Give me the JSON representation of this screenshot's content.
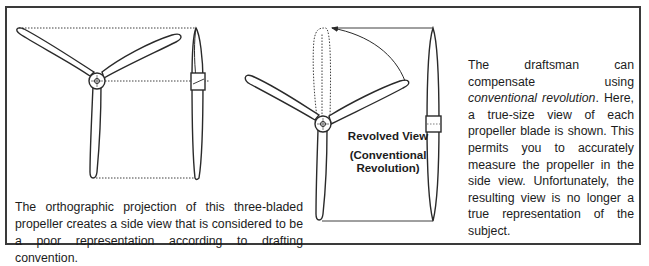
{
  "figure": {
    "left_caption": "The orthographic projection of this three-bladed propeller creates a side view that is considered to be a poor representation according to drafting convention.",
    "revolved_label": {
      "title": "Revolved View",
      "subtitle_line1": "(Conventional",
      "subtitle_line2": "Revolution)"
    },
    "right_caption": {
      "part1": "The draftsman can compensate using ",
      "emphasis": "conventional revolution",
      "part2": ". Here, a true-size view of each propeller blade is shown. This permits you to accurately measure the propeller in the side view. Unfortunately, the resulting view is no longer a true representation of the subject."
    },
    "colors": {
      "line": "#2a2a2a",
      "border": "#3a3a3a",
      "background": "#ffffff"
    },
    "drawings": [
      {
        "name": "front-view-propeller",
        "blades": 3
      },
      {
        "name": "orthographic-side-view"
      },
      {
        "name": "revolved-front-view-propeller",
        "blades": 3
      },
      {
        "name": "revolved-side-view"
      }
    ]
  }
}
